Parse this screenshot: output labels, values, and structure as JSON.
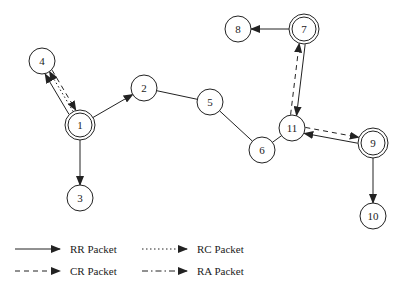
{
  "nodes": [
    {
      "id": "1",
      "x": 80,
      "y": 125,
      "double": true
    },
    {
      "id": "2",
      "x": 144,
      "y": 88,
      "double": false
    },
    {
      "id": "3",
      "x": 80,
      "y": 198,
      "double": false
    },
    {
      "id": "4",
      "x": 42,
      "y": 61,
      "double": false
    },
    {
      "id": "5",
      "x": 210,
      "y": 102,
      "double": false
    },
    {
      "id": "6",
      "x": 262,
      "y": 150,
      "double": false
    },
    {
      "id": "7",
      "x": 304,
      "y": 29,
      "double": true
    },
    {
      "id": "8",
      "x": 238,
      "y": 29,
      "double": false
    },
    {
      "id": "9",
      "x": 373,
      "y": 143,
      "double": true
    },
    {
      "id": "10",
      "x": 373,
      "y": 216,
      "double": false
    },
    {
      "id": "11",
      "x": 292,
      "y": 128,
      "double": false
    }
  ],
  "edges": [
    {
      "from": "1",
      "to": "4",
      "type": "RR",
      "offset": -4
    },
    {
      "from": "1",
      "to": "4",
      "type": "RC",
      "offset": 1
    },
    {
      "from": "4",
      "to": "1",
      "type": "CR",
      "offset": -4
    },
    {
      "from": "1",
      "to": "2",
      "type": "RR",
      "offset": 0
    },
    {
      "from": "1",
      "to": "3",
      "type": "RR",
      "offset": 0
    },
    {
      "from": "2",
      "to": "5",
      "type": "LINK",
      "offset": 0
    },
    {
      "from": "5",
      "to": "6",
      "type": "LINK",
      "offset": 0
    },
    {
      "from": "6",
      "to": "11",
      "type": "LINK",
      "offset": 0
    },
    {
      "from": "7",
      "to": "11",
      "type": "RR",
      "offset": -3
    },
    {
      "from": "11",
      "to": "7",
      "type": "CR",
      "offset": -3
    },
    {
      "from": "7",
      "to": "8",
      "type": "RR",
      "offset": 0
    },
    {
      "from": "9",
      "to": "11",
      "type": "RR",
      "offset": -3
    },
    {
      "from": "11",
      "to": "9",
      "type": "CR",
      "offset": -3
    },
    {
      "from": "9",
      "to": "10",
      "type": "RR",
      "offset": 0
    }
  ],
  "legend": {
    "items": [
      {
        "label": "RR Packet",
        "type": "RR",
        "x": 15,
        "y": 249
      },
      {
        "label": "RC Packet",
        "type": "RC",
        "x": 142,
        "y": 249
      },
      {
        "label": "CR Packet",
        "type": "CR",
        "x": 15,
        "y": 271
      },
      {
        "label": "RA Packet",
        "type": "RA",
        "x": 142,
        "y": 271
      }
    ]
  },
  "styles": {
    "stroke_color": "#222222",
    "node_radius": 13
  }
}
